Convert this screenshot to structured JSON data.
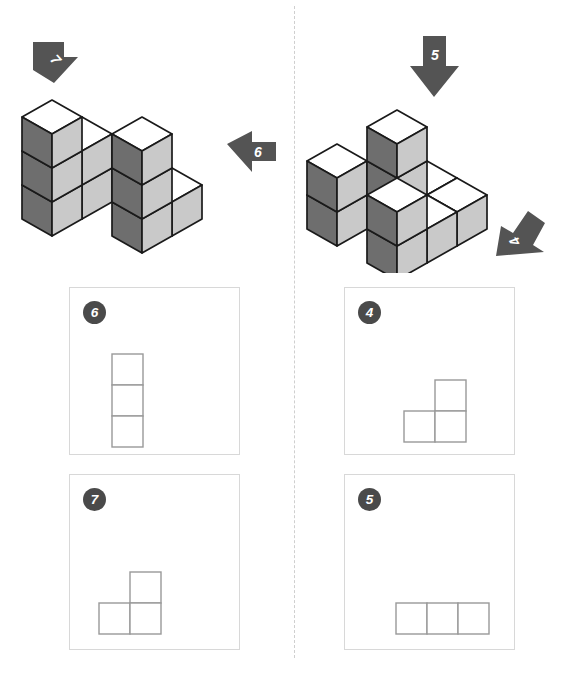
{
  "page": {
    "background_color": "#ffffff",
    "width": 572,
    "height": 684
  },
  "divider": {
    "name": "vertical-dashed-divider",
    "color": "#cfcfcf",
    "style": "dashed"
  },
  "colors": {
    "cube_top": "#ffffff",
    "cube_left": "#6e6e6e",
    "cube_right": "#c9c9c9",
    "cube_outline": "#1a1a1a",
    "arrow_fill": "#545454",
    "badge_fill": "#4a4a4a",
    "badge_text": "#ffffff",
    "box_border": "#d8d8d8",
    "square_border": "#999999",
    "square_fill": "#ffffff"
  },
  "figures": [
    {
      "name": "left-figure",
      "label": "cube-structure-left",
      "cube_count": 11,
      "description": "Isometric stack of cubes: L-shaped base with two towers",
      "cubes": [
        {
          "x": 0,
          "y": 0,
          "z": 0
        },
        {
          "x": 1,
          "y": 0,
          "z": 0
        },
        {
          "x": 2,
          "y": 0,
          "z": 0
        },
        {
          "x": 0,
          "y": 1,
          "z": 0
        },
        {
          "x": 1,
          "y": 1,
          "z": 0
        },
        {
          "x": 2,
          "y": 1,
          "z": 0
        },
        {
          "x": 0,
          "y": 1,
          "z": 1
        },
        {
          "x": 0,
          "y": 2,
          "z": 0
        },
        {
          "x": 0,
          "y": 2,
          "z": 1
        },
        {
          "x": 0,
          "y": 2,
          "z": 2
        },
        {
          "x": 2,
          "y": 1,
          "z": 1
        }
      ],
      "arrows": [
        {
          "number": "7",
          "direction": "down-right",
          "name": "arrow-7"
        },
        {
          "number": "6",
          "direction": "left",
          "name": "arrow-6"
        }
      ]
    },
    {
      "name": "right-figure",
      "label": "cube-structure-right",
      "cube_count": 12,
      "description": "Isometric stack of cubes: base row with three towers",
      "arrows": [
        {
          "number": "5",
          "direction": "down",
          "name": "arrow-5"
        },
        {
          "number": "4",
          "direction": "up-left",
          "name": "arrow-4"
        }
      ]
    }
  ],
  "answer_boxes": [
    {
      "name": "answer-box-6",
      "badge": "6",
      "shape_name": "vertical-tri-stack",
      "shape_description": "Three squares stacked vertically",
      "cells": [
        [
          0,
          0
        ],
        [
          0,
          1
        ],
        [
          0,
          2
        ]
      ],
      "grid_cols": 1,
      "grid_rows": 3
    },
    {
      "name": "answer-box-4",
      "badge": "4",
      "shape_name": "L-shape-right",
      "shape_description": "One square on top-right with two squares beneath forming an L",
      "cells": [
        [
          1,
          0
        ],
        [
          0,
          1
        ],
        [
          1,
          1
        ]
      ],
      "grid_cols": 2,
      "grid_rows": 2
    },
    {
      "name": "answer-box-7",
      "badge": "7",
      "shape_name": "L-shape-left",
      "shape_description": "One square on top-right with two squares beneath forming an L",
      "cells": [
        [
          1,
          0
        ],
        [
          0,
          1
        ],
        [
          1,
          1
        ]
      ],
      "grid_cols": 2,
      "grid_rows": 2
    },
    {
      "name": "answer-box-5",
      "badge": "5",
      "shape_name": "horizontal-tri-row",
      "shape_description": "Three squares in a horizontal row",
      "cells": [
        [
          0,
          0
        ],
        [
          1,
          0
        ],
        [
          2,
          0
        ]
      ],
      "grid_cols": 3,
      "grid_rows": 1
    }
  ]
}
